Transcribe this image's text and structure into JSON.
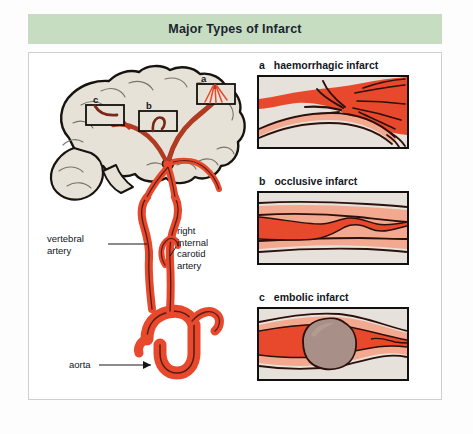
{
  "title": "Major Types of Infarct",
  "colors": {
    "banner_green": "#c6ddc1",
    "artery_red": "#e8492c",
    "artery_light": "#f08a6e",
    "vessel_outline": "#3b1410",
    "panel_background": "#e6e1da",
    "embolus": "#a89088",
    "brain_fill": "#e7e2d8",
    "brain_outline": "#17130f",
    "text": "#12161c",
    "frame_border": "#cfcfcf"
  },
  "brain_diagram": {
    "name": "cerebral arterial circulation",
    "box_markers": [
      {
        "letter": "a",
        "meaning": "haemorrhagic infarct site"
      },
      {
        "letter": "b",
        "meaning": "occlusive infarct site"
      },
      {
        "letter": "c",
        "meaning": "embolic infarct site"
      }
    ],
    "labels": [
      {
        "id": "vertebral",
        "text": "vertebral\nartery",
        "lines": [
          "vertebral",
          "artery"
        ]
      },
      {
        "id": "carotid",
        "text": "right internal carotid artery",
        "lines": [
          "right",
          "internal",
          "carotid",
          "artery"
        ]
      },
      {
        "id": "aorta",
        "text": "aorta",
        "lines": [
          "aorta"
        ]
      }
    ]
  },
  "panels": [
    {
      "letter": "a",
      "label": "haemorrhagic infarct",
      "description": "blood extravasation radiating from branching artery"
    },
    {
      "letter": "b",
      "label": "occlusive infarct",
      "description": "vessel lumen narrowing to thin irregular channel"
    },
    {
      "letter": "c",
      "label": "embolic infarct",
      "description": "solid embolus lodged in vessel lumen"
    }
  ]
}
